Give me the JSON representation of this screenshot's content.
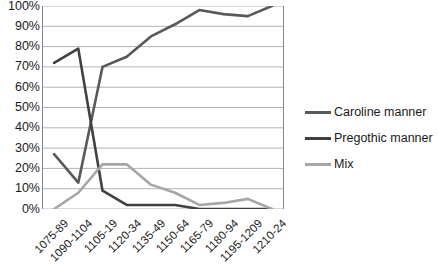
{
  "chart_data": {
    "type": "line",
    "title": "",
    "xlabel": "",
    "ylabel": "",
    "categories": [
      "1075-89",
      "1090-1104",
      "1105-19",
      "1120-34",
      "1135-49",
      "1150-64",
      "1165-79",
      "1180-94",
      "1195-1209",
      "1210-24"
    ],
    "ylim": [
      0,
      100
    ],
    "ytick_labels": [
      "100%",
      "90%",
      "80%",
      "70%",
      "60%",
      "50%",
      "40%",
      "30%",
      "20%",
      "10%",
      "0%"
    ],
    "ytick_values": [
      100,
      90,
      80,
      70,
      60,
      50,
      40,
      30,
      20,
      10,
      0
    ],
    "grid": true,
    "legend_position": "right",
    "series": [
      {
        "name": "Caroline manner",
        "color": "#595959",
        "values": [
          27,
          13,
          70,
          75,
          85,
          91,
          98,
          96,
          95,
          100
        ]
      },
      {
        "name": "Pregothic manner",
        "color": "#404040",
        "values": [
          72,
          79,
          9,
          2,
          2,
          2,
          0,
          0,
          0,
          0
        ]
      },
      {
        "name": "Mix",
        "color": "#a6a6a6",
        "values": [
          0,
          8,
          22,
          22,
          12,
          8,
          2,
          3,
          5,
          0
        ]
      }
    ]
  },
  "legend": {
    "items": [
      {
        "label": "Caroline manner",
        "color": "#595959"
      },
      {
        "label": "Pregothic manner",
        "color": "#404040"
      },
      {
        "label": "Mix",
        "color": "#a6a6a6"
      }
    ]
  },
  "axes": {
    "gridline_color": "#b3b3b3",
    "axis_color": "#868686"
  }
}
